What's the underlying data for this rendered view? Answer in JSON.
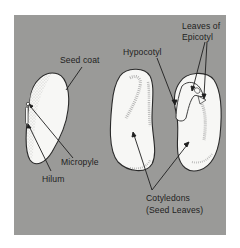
{
  "diagram": {
    "type": "bean seed anatomy",
    "background_color": "#9a9a98",
    "seed_fill": "#f7f7f5",
    "outline_color": "#2a2a2a",
    "labels": {
      "seed_coat": "Seed coat",
      "micropyle": "Micropyle",
      "hilum": "Hilum",
      "hypocotyl": "Hypocotyl",
      "leaves_of_epicotyl_line1": "Leaves of",
      "leaves_of_epicotyl_line2": "Epicotyl",
      "cotyledons_line1": "Cotyledons",
      "cotyledons_line2": "(Seed Leaves)"
    },
    "parts": [
      "whole-seed-with-coat",
      "left-cotyledon",
      "right-cotyledon-with-embryo"
    ]
  }
}
